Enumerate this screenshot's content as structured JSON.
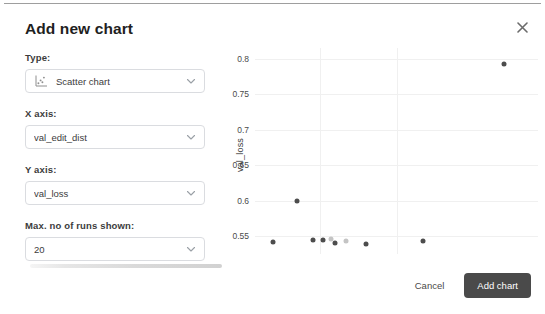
{
  "dialog": {
    "title": "Add new chart",
    "close_icon": "close-icon"
  },
  "form": {
    "fields": [
      {
        "label": "Type:",
        "value": "Scatter chart",
        "icon": "scatter-chart-icon",
        "caret": "chevron-down-icon"
      },
      {
        "label": "X axis:",
        "value": "val_edit_dist",
        "caret": "chevron-down-icon"
      },
      {
        "label": "Y axis:",
        "value": "val_loss",
        "caret": "chevron-down-icon"
      },
      {
        "label": "Max. no of runs shown:",
        "value": "20",
        "caret": "chevron-down-icon"
      }
    ]
  },
  "footer": {
    "cancel_label": "Cancel",
    "add_label": "Add chart"
  },
  "colors": {
    "button_primary": "#4a4a4a",
    "grid": "#f0f0f0",
    "dot_dark": "#4d4d4d",
    "dot_light": "#c4c4c4",
    "border": "#dadce0"
  },
  "chart_data": {
    "type": "scatter",
    "title": "",
    "xlabel": "val_edit_dist",
    "ylabel": "val_loss",
    "ylim": [
      0.525,
      0.815
    ],
    "yticks": [
      0.8,
      0.75,
      0.7,
      0.65,
      0.6,
      0.55
    ],
    "xlim": [
      0,
      1
    ],
    "xticks": [],
    "grid": true,
    "legend": false,
    "x_gridlines_frac": [
      0.23,
      0.5
    ],
    "points": [
      {
        "x_frac": 0.063,
        "y": 0.5425,
        "shade": "dark"
      },
      {
        "x_frac": 0.205,
        "y": 0.5445,
        "shade": "dark"
      },
      {
        "x_frac": 0.24,
        "y": 0.545,
        "shade": "dark"
      },
      {
        "x_frac": 0.268,
        "y": 0.5465,
        "shade": "light"
      },
      {
        "x_frac": 0.283,
        "y": 0.54,
        "shade": "dark"
      },
      {
        "x_frac": 0.322,
        "y": 0.5435,
        "shade": "light"
      },
      {
        "x_frac": 0.393,
        "y": 0.5395,
        "shade": "dark"
      },
      {
        "x_frac": 0.149,
        "y": 0.599,
        "shade": "dark"
      },
      {
        "x_frac": 0.594,
        "y": 0.543,
        "shade": "dark"
      },
      {
        "x_frac": 0.88,
        "y": 0.792,
        "shade": "dark"
      }
    ]
  }
}
